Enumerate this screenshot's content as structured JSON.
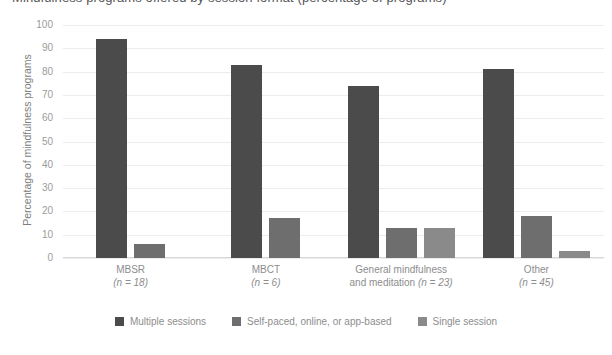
{
  "title_cut": "Mindfulness programs offered by session format (percentage of programs)",
  "chart_data": {
    "type": "bar",
    "title": "",
    "xlabel": "",
    "ylabel": "Percentage of mindfulness programs",
    "ylim": [
      0,
      100
    ],
    "yticks": [
      "0",
      "10",
      "20",
      "30",
      "40",
      "50",
      "60",
      "70",
      "80",
      "90",
      "100"
    ],
    "grid": true,
    "legend_position": "bottom",
    "categories": [
      "MBSR",
      "MBCT",
      "General mindfulness and meditation",
      "Other"
    ],
    "category_lines": [
      [
        "MBSR",
        "(n = 18)"
      ],
      [
        "MBCT",
        "(n = 6)"
      ],
      [
        "General mindfulness",
        "and meditation (n = 23)"
      ],
      [
        "Other",
        "(n = 45)"
      ]
    ],
    "category_counts": [
      18,
      6,
      23,
      45
    ],
    "series": [
      {
        "name": "Multiple sessions",
        "color": "#4b4b4b",
        "values": [
          94,
          83,
          74,
          81
        ]
      },
      {
        "name": "Self-paced, online, or app-based",
        "color": "#6e6e6e",
        "values": [
          6,
          17,
          13,
          18
        ]
      },
      {
        "name": "Single session",
        "color": "#8a8a8a",
        "values": [
          0,
          0,
          13,
          3
        ]
      }
    ]
  },
  "legend": {
    "items": [
      {
        "label": "Multiple sessions",
        "color": "#4b4b4b"
      },
      {
        "label": "Self-paced, online, or app-based",
        "color": "#6e6e6e"
      },
      {
        "label": "Single session",
        "color": "#8a8a8a"
      }
    ]
  }
}
